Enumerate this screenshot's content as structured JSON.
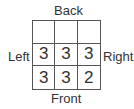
{
  "labels": {
    "back": "Back",
    "front": "Front",
    "left": "Left",
    "right": "Right"
  },
  "grid": {
    "rows": [
      [
        "",
        "",
        ""
      ],
      [
        "3",
        "3",
        "3"
      ],
      [
        "3",
        "3",
        "2"
      ]
    ]
  }
}
